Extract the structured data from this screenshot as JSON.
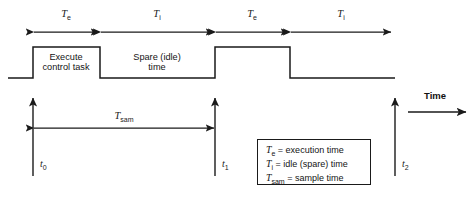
{
  "diagram": {
    "stroke_color": "#1a1a1a",
    "background": "#ffffff"
  },
  "intervals": [
    {
      "name": "interval-te-first",
      "label": "T",
      "sub": "e",
      "x_start": 33,
      "x_end": 100,
      "label_x": 66
    },
    {
      "name": "interval-ti-first",
      "label": "T",
      "sub": "i",
      "x_start": 100,
      "x_end": 215,
      "label_x": 157
    },
    {
      "name": "interval-te-second",
      "label": "T",
      "sub": "e",
      "x_start": 215,
      "x_end": 290,
      "label_x": 252
    },
    {
      "name": "interval-ti-second",
      "label": "T",
      "sub": "i",
      "x_start": 290,
      "x_end": 392,
      "label_x": 341
    }
  ],
  "waveform": {
    "baseline_y": 78,
    "high_y": 47,
    "x_left": 8,
    "x_right": 395,
    "pulses": [
      {
        "name": "pulse-execute",
        "rise_x": 33,
        "fall_x": 100
      },
      {
        "name": "pulse-execute-second",
        "rise_x": 215,
        "fall_x": 290
      }
    ],
    "annotations": [
      {
        "name": "execute-task-label",
        "line1": "Execute",
        "line2": "control task",
        "center_x": 66,
        "y": 53
      },
      {
        "name": "spare-idle-label",
        "line1": "Spare (idle)",
        "line2": "time",
        "center_x": 157,
        "y": 53
      }
    ]
  },
  "time_markers": [
    {
      "name": "marker-t0",
      "label": "t",
      "sub": "0",
      "x": 33,
      "y_top": 97,
      "y_bottom": 176,
      "label_x": 40,
      "label_y": 160
    },
    {
      "name": "marker-t1",
      "label": "t",
      "sub": "1",
      "x": 215,
      "y_top": 97,
      "y_bottom": 176,
      "label_x": 222,
      "label_y": 160
    },
    {
      "name": "marker-t2",
      "label": "t",
      "sub": "2",
      "x": 395,
      "y_top": 97,
      "y_bottom": 176,
      "label_x": 402,
      "label_y": 160
    }
  ],
  "sample_interval": {
    "name": "interval-tsam",
    "label": "T",
    "sub": "sam",
    "x_start": 33,
    "x_end": 215,
    "y": 128,
    "label_x": 124,
    "label_y": 112
  },
  "time_axis": {
    "label": "Time",
    "label_x": 425,
    "label_y": 96,
    "arrow_y": 112,
    "arrow_x_start": 408,
    "arrow_x_end": 468
  },
  "legend": {
    "title": "Symbol definitions",
    "rows": [
      {
        "name": "legend-row-te",
        "sym": "T",
        "sub": "e",
        "text": " = execution time",
        "y": 4
      },
      {
        "name": "legend-row-ti",
        "sym": "T",
        "sub": "i",
        "text": " = idle (spare) time",
        "y": 18
      },
      {
        "name": "legend-row-tsam",
        "sym": "T",
        "sub": "sam",
        "text": " = sample time",
        "y": 32
      }
    ]
  }
}
